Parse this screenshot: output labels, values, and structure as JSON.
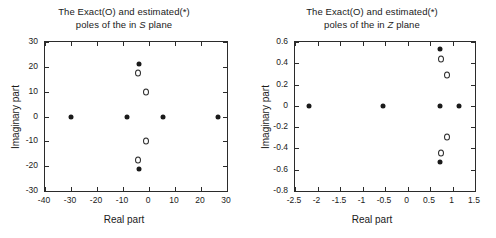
{
  "figure": {
    "width": 496,
    "height": 238,
    "background": "#ffffff",
    "marker_color": "#1a1a1a",
    "axis_color": "#2b2b2b"
  },
  "panels": [
    {
      "id": "s-plane",
      "title_line1": "The Exact(O) and estimated(*)",
      "title_line2_pre": "poles of the in ",
      "title_line2_ital": "S",
      "title_line2_post": " plane",
      "xlabel": "Real part",
      "ylabel": "Imaginary part",
      "xticks": [
        "-40",
        "-30",
        "-20",
        "-10",
        "0",
        "10",
        "20",
        "30"
      ],
      "yticks": [
        "30",
        "20",
        "10",
        "0",
        "-10",
        "-20",
        "-30"
      ]
    },
    {
      "id": "z-plane",
      "title_line1": "The Exact(O) and estimated(*)",
      "title_line2_pre": "poles of the in ",
      "title_line2_ital": "Z",
      "title_line2_post": " plane",
      "xlabel": "Real part",
      "ylabel": "Imaginary part",
      "xticks": [
        "-2.5",
        "-2",
        "-1.5",
        "-1",
        "-0.5",
        "0",
        "0.5",
        "1",
        "1.5"
      ],
      "yticks": [
        "0.6",
        "0.4",
        "0.2",
        "0",
        "-0.2",
        "-0.4",
        "-0.6",
        "-0.8"
      ]
    }
  ],
  "chart_data": [
    {
      "type": "scatter",
      "id": "s-plane",
      "title": "The Exact(O) and estimated(*) poles of the in S plane",
      "xlabel": "Real part",
      "ylabel": "Imaginary part",
      "xlim": [
        -40,
        30
      ],
      "ylim": [
        -30,
        30
      ],
      "xtick_values": [
        -40,
        -30,
        -20,
        -10,
        0,
        10,
        20,
        30
      ],
      "ytick_values": [
        -30,
        -20,
        -10,
        0,
        10,
        20,
        30
      ],
      "grid": false,
      "legend": "none",
      "series": [
        {
          "name": "estimated(*)",
          "marker": "asterisk",
          "points": [
            [
              -30.0,
              0.0
            ],
            [
              -8.5,
              0.0
            ],
            [
              5.5,
              0.0
            ],
            [
              26.5,
              0.0
            ],
            [
              -4.0,
              21.3
            ],
            [
              -4.0,
              -21.3
            ]
          ]
        },
        {
          "name": "Exact(O)",
          "marker": "circle",
          "points": [
            [
              -4.3,
              17.5
            ],
            [
              -4.3,
              -17.5
            ],
            [
              -1.3,
              10.0
            ],
            [
              -1.3,
              -10.0
            ]
          ]
        }
      ]
    },
    {
      "type": "scatter",
      "id": "z-plane",
      "title": "The Exact(O) and estimated(*) poles of the in Z plane",
      "xlabel": "Real part",
      "ylabel": "Imaginary part",
      "xlim": [
        -2.5,
        1.5
      ],
      "ylim": [
        -0.8,
        0.6
      ],
      "xtick_values": [
        -2.5,
        -2,
        -1.5,
        -1,
        -0.5,
        0,
        0.5,
        1,
        1.5
      ],
      "ytick_values": [
        -0.8,
        -0.6,
        -0.4,
        -0.2,
        0,
        0.2,
        0.4,
        0.6
      ],
      "grid": false,
      "legend": "none",
      "series": [
        {
          "name": "estimated(*)",
          "marker": "asterisk",
          "points": [
            [
              -2.2,
              0.0
            ],
            [
              -0.55,
              0.0
            ],
            [
              0.72,
              0.0
            ],
            [
              1.15,
              0.0
            ],
            [
              0.72,
              0.53
            ],
            [
              0.72,
              -0.53
            ]
          ]
        },
        {
          "name": "Exact(O)",
          "marker": "circle",
          "points": [
            [
              0.75,
              0.44
            ],
            [
              0.75,
              -0.44
            ],
            [
              0.88,
              0.29
            ],
            [
              0.88,
              -0.29
            ]
          ]
        }
      ]
    }
  ]
}
